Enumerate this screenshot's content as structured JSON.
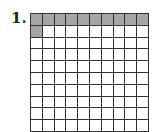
{
  "problem": {
    "number_label": "1.",
    "grid": {
      "rows": 10,
      "cols": 10,
      "shaded_count": 11,
      "shaded_color": "#a6a6a6",
      "unshaded_color": "#ffffff",
      "line_color": "#333333"
    }
  }
}
